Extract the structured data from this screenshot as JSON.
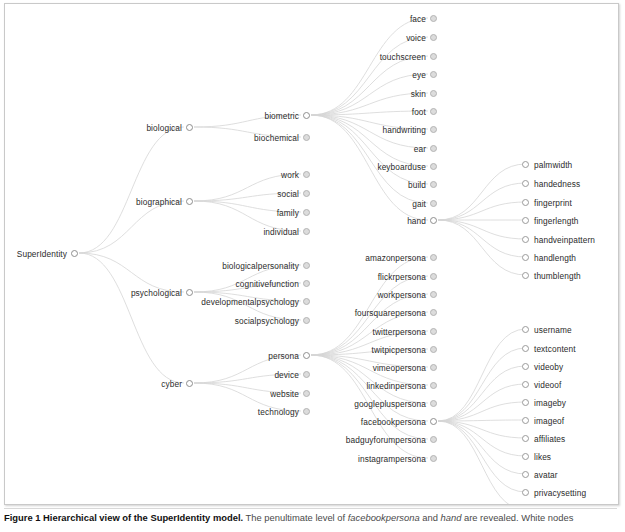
{
  "figure": {
    "caption_bold": "Figure 1 Hierarchical view of the SuperIdentity model.",
    "caption_rest_1": " The penultimate level of ",
    "caption_em_1": "facebookpersona",
    "caption_rest_2": " and ",
    "caption_em_2": "hand",
    "caption_rest_3": " are revealed. White nodes"
  },
  "colors": {
    "node_stroke": "#9a9a9a",
    "node_fill_collapsed": "#dcdcdc",
    "node_fill_open": "#ffffff",
    "link": "#d6d6d6",
    "text": "#2b2b2b",
    "frame": "#c9c9c9"
  },
  "tree": {
    "root": {
      "label": "SuperIdentity",
      "state": "open",
      "x": 73,
      "y": 252
    },
    "level1": [
      {
        "label": "biological",
        "state": "open",
        "x": 188,
        "y": 126
      },
      {
        "label": "biographical",
        "state": "open",
        "x": 188,
        "y": 200
      },
      {
        "label": "psychological",
        "state": "open",
        "x": 188,
        "y": 291
      },
      {
        "label": "cyber",
        "state": "open",
        "x": 188,
        "y": 382
      }
    ],
    "biological_children": [
      {
        "label": "biometric",
        "state": "open",
        "x": 305,
        "y": 114
      },
      {
        "label": "biochemical",
        "state": "collapsed",
        "x": 305,
        "y": 136
      }
    ],
    "biographical_children": [
      {
        "label": "work",
        "state": "collapsed",
        "x": 305,
        "y": 173
      },
      {
        "label": "social",
        "state": "collapsed",
        "x": 305,
        "y": 192
      },
      {
        "label": "family",
        "state": "collapsed",
        "x": 305,
        "y": 211
      },
      {
        "label": "individual",
        "state": "collapsed",
        "x": 305,
        "y": 230
      }
    ],
    "psychological_children": [
      {
        "label": "biologicalpersonality",
        "state": "collapsed",
        "x": 305,
        "y": 264
      },
      {
        "label": "cognitivefunction",
        "state": "collapsed",
        "x": 305,
        "y": 282
      },
      {
        "label": "developmentalpsychology",
        "state": "collapsed",
        "x": 305,
        "y": 300
      },
      {
        "label": "socialpsychology",
        "state": "collapsed",
        "x": 305,
        "y": 319
      }
    ],
    "cyber_children": [
      {
        "label": "persona",
        "state": "open",
        "x": 305,
        "y": 354
      },
      {
        "label": "device",
        "state": "collapsed",
        "x": 305,
        "y": 373
      },
      {
        "label": "website",
        "state": "collapsed",
        "x": 305,
        "y": 392
      },
      {
        "label": "technology",
        "state": "collapsed",
        "x": 305,
        "y": 410
      }
    ],
    "biometric_children": [
      {
        "label": "face",
        "state": "collapsed",
        "x": 432,
        "y": 17
      },
      {
        "label": "voice",
        "state": "collapsed",
        "x": 432,
        "y": 36
      },
      {
        "label": "touchscreen",
        "state": "collapsed",
        "x": 432,
        "y": 55
      },
      {
        "label": "eye",
        "state": "collapsed",
        "x": 432,
        "y": 73
      },
      {
        "label": "skin",
        "state": "collapsed",
        "x": 432,
        "y": 92
      },
      {
        "label": "foot",
        "state": "collapsed",
        "x": 432,
        "y": 110
      },
      {
        "label": "handwriting",
        "state": "collapsed",
        "x": 432,
        "y": 128
      },
      {
        "label": "ear",
        "state": "collapsed",
        "x": 432,
        "y": 147
      },
      {
        "label": "keyboarduse",
        "state": "collapsed",
        "x": 432,
        "y": 165
      },
      {
        "label": "build",
        "state": "collapsed",
        "x": 432,
        "y": 183
      },
      {
        "label": "gait",
        "state": "collapsed",
        "x": 432,
        "y": 202
      },
      {
        "label": "hand",
        "state": "open",
        "x": 432,
        "y": 219
      }
    ],
    "persona_children": [
      {
        "label": "amazonpersona",
        "state": "collapsed",
        "x": 432,
        "y": 256
      },
      {
        "label": "flickrpersona",
        "state": "collapsed",
        "x": 432,
        "y": 275
      },
      {
        "label": "workpersona",
        "state": "collapsed",
        "x": 432,
        "y": 293
      },
      {
        "label": "foursquarepersona",
        "state": "collapsed",
        "x": 432,
        "y": 311
      },
      {
        "label": "twitterpersona",
        "state": "collapsed",
        "x": 432,
        "y": 330
      },
      {
        "label": "twitpicpersona",
        "state": "collapsed",
        "x": 432,
        "y": 348
      },
      {
        "label": "vimeopersona",
        "state": "collapsed",
        "x": 432,
        "y": 366
      },
      {
        "label": "linkedinpersona",
        "state": "collapsed",
        "x": 432,
        "y": 384
      },
      {
        "label": "googlepluspersona",
        "state": "collapsed",
        "x": 432,
        "y": 402
      },
      {
        "label": "facebookpersona",
        "state": "open",
        "x": 432,
        "y": 420
      },
      {
        "label": "badguyforumpersona",
        "state": "collapsed",
        "x": 432,
        "y": 438
      },
      {
        "label": "instagrampersona",
        "state": "collapsed",
        "x": 432,
        "y": 457
      }
    ],
    "hand_children": [
      {
        "label": "palmwidth",
        "state": "leaf",
        "x": 530,
        "y": 163
      },
      {
        "label": "handedness",
        "state": "leaf",
        "x": 530,
        "y": 182
      },
      {
        "label": "fingerprint",
        "state": "leaf",
        "x": 530,
        "y": 201
      },
      {
        "label": "fingerlength",
        "state": "leaf",
        "x": 530,
        "y": 219
      },
      {
        "label": "handveinpattern",
        "state": "leaf",
        "x": 530,
        "y": 238
      },
      {
        "label": "handlength",
        "state": "leaf",
        "x": 530,
        "y": 256
      },
      {
        "label": "thumblength",
        "state": "leaf",
        "x": 530,
        "y": 274
      }
    ],
    "facebookpersona_children": [
      {
        "label": "username",
        "state": "leaf",
        "x": 530,
        "y": 328
      },
      {
        "label": "textcontent",
        "state": "leaf",
        "x": 530,
        "y": 347
      },
      {
        "label": "videoby",
        "state": "leaf",
        "x": 530,
        "y": 365
      },
      {
        "label": "videoof",
        "state": "leaf",
        "x": 530,
        "y": 383
      },
      {
        "label": "imageby",
        "state": "leaf",
        "x": 530,
        "y": 401
      },
      {
        "label": "imageof",
        "state": "leaf",
        "x": 530,
        "y": 419
      },
      {
        "label": "affiliates",
        "state": "leaf",
        "x": 530,
        "y": 437
      },
      {
        "label": "likes",
        "state": "leaf",
        "x": 530,
        "y": 455
      },
      {
        "label": "avatar",
        "state": "leaf",
        "x": 530,
        "y": 473
      },
      {
        "label": "privacysetting",
        "state": "leaf",
        "x": 530,
        "y": 491
      },
      {
        "label": "groupmembership",
        "state": "leaf",
        "x": 530,
        "y": 509
      }
    ]
  }
}
